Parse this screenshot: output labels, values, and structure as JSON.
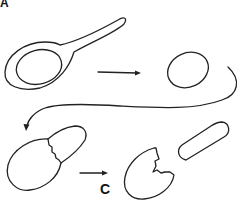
{
  "figure": {
    "panel_label": "A",
    "step_label": "C",
    "stroke_color": "#222222",
    "background_color": "#ffffff",
    "elements": [
      {
        "name": "keyhole-shaped-cell",
        "description": "ring-like cell with elongated tail"
      },
      {
        "name": "arrow-right-1",
        "description": "straight arrow pointing right"
      },
      {
        "name": "oval-cell",
        "description": "closed oval shape"
      },
      {
        "name": "curved-return-arrow",
        "description": "long curved arrow from upper right to lower left"
      },
      {
        "name": "budding-cell",
        "description": "oval cell with attached bud joined by jagged seam"
      },
      {
        "name": "arrow-right-2",
        "description": "short arrow pointing right above label C"
      },
      {
        "name": "broken-shell",
        "description": "open cell shell with jagged broken edge"
      },
      {
        "name": "released-rod",
        "description": "rounded rod-shaped cell"
      }
    ]
  }
}
